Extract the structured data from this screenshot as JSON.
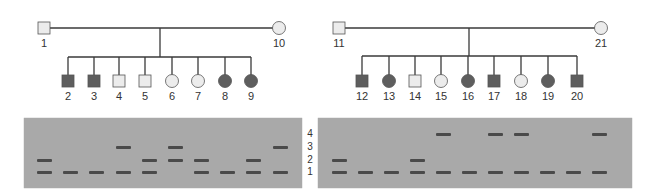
{
  "colors": {
    "affected": "#5e5e5e",
    "unaffected": "#ececec",
    "outline": "#555555",
    "line": "#3a3a3a",
    "gel_background": "#a9a9a9",
    "band": "#4a4a4a"
  },
  "families": [
    {
      "parents": [
        {
          "id": "1",
          "sex": "male",
          "affected": false,
          "x": 44,
          "y": 28
        },
        {
          "id": "10",
          "sex": "female",
          "affected": false,
          "x": 279,
          "y": 28
        }
      ],
      "drop_x": 160,
      "sibline_y": 57,
      "children": [
        {
          "id": "2",
          "sex": "male",
          "affected": true,
          "x": 68
        },
        {
          "id": "3",
          "sex": "male",
          "affected": true,
          "x": 94
        },
        {
          "id": "4",
          "sex": "male",
          "affected": false,
          "x": 119
        },
        {
          "id": "5",
          "sex": "male",
          "affected": false,
          "x": 145
        },
        {
          "id": "6",
          "sex": "female",
          "affected": false,
          "x": 172
        },
        {
          "id": "7",
          "sex": "female",
          "affected": false,
          "x": 198
        },
        {
          "id": "8",
          "sex": "female",
          "affected": true,
          "x": 225
        },
        {
          "id": "9",
          "sex": "female",
          "affected": true,
          "x": 251
        }
      ]
    },
    {
      "parents": [
        {
          "id": "11",
          "sex": "male",
          "affected": false,
          "x": 339,
          "y": 28
        },
        {
          "id": "21",
          "sex": "female",
          "affected": false,
          "x": 601,
          "y": 28
        }
      ],
      "drop_x": 469,
      "sibline_y": 56,
      "children": [
        {
          "id": "12",
          "sex": "male",
          "affected": true,
          "x": 362
        },
        {
          "id": "13",
          "sex": "female",
          "affected": true,
          "x": 389
        },
        {
          "id": "14",
          "sex": "male",
          "affected": false,
          "x": 415
        },
        {
          "id": "15",
          "sex": "female",
          "affected": false,
          "x": 441
        },
        {
          "id": "16",
          "sex": "female",
          "affected": true,
          "x": 468
        },
        {
          "id": "17",
          "sex": "male",
          "affected": true,
          "x": 494
        },
        {
          "id": "18",
          "sex": "female",
          "affected": false,
          "x": 521
        },
        {
          "id": "19",
          "sex": "female",
          "affected": true,
          "x": 548
        },
        {
          "id": "20",
          "sex": "male",
          "affected": true,
          "x": 577
        }
      ]
    }
  ],
  "band_levels": {
    "labels": [
      "4",
      "3",
      "2",
      "1"
    ],
    "y": {
      "4": 134,
      "3": 147,
      "2": 160,
      "1": 172
    },
    "label_x": 310
  },
  "gels": [
    {
      "x": 24,
      "y": 118,
      "width": 278,
      "height": 70,
      "lanes": [
        {
          "x": 45,
          "bands": [
            2,
            1
          ]
        },
        {
          "x": 71,
          "bands": [
            1
          ]
        },
        {
          "x": 97,
          "bands": [
            1
          ]
        },
        {
          "x": 124,
          "bands": [
            3,
            1
          ]
        },
        {
          "x": 150,
          "bands": [
            2,
            1
          ]
        },
        {
          "x": 176,
          "bands": [
            3,
            2
          ]
        },
        {
          "x": 202,
          "bands": [
            2,
            1
          ]
        },
        {
          "x": 228,
          "bands": [
            1
          ]
        },
        {
          "x": 254,
          "bands": [
            2,
            1
          ]
        },
        {
          "x": 281,
          "bands": [
            3,
            1
          ]
        }
      ]
    },
    {
      "x": 318,
      "y": 118,
      "width": 314,
      "height": 70,
      "lanes": [
        {
          "x": 340,
          "bands": [
            2,
            1
          ]
        },
        {
          "x": 366,
          "bands": [
            1
          ]
        },
        {
          "x": 392,
          "bands": [
            1
          ]
        },
        {
          "x": 418,
          "bands": [
            2,
            1
          ]
        },
        {
          "x": 444,
          "bands": [
            4,
            1
          ]
        },
        {
          "x": 470,
          "bands": [
            1
          ]
        },
        {
          "x": 496,
          "bands": [
            4,
            1
          ]
        },
        {
          "x": 522,
          "bands": [
            4,
            1
          ]
        },
        {
          "x": 548,
          "bands": [
            1
          ]
        },
        {
          "x": 574,
          "bands": [
            1
          ]
        },
        {
          "x": 600,
          "bands": [
            4,
            1
          ]
        }
      ]
    }
  ]
}
